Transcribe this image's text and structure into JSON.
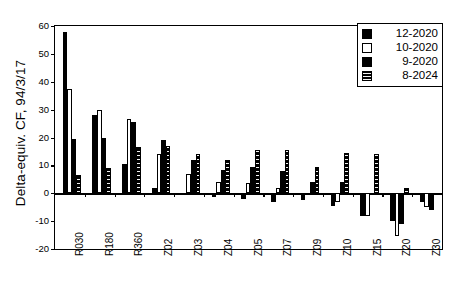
{
  "chart_data": {
    "type": "bar",
    "title": "",
    "subtitle": "",
    "xlabel": "",
    "ylabel": "Delta-equiv. CF, 94/3/17",
    "ylim": [
      -20,
      60
    ],
    "ytick_labels": [
      "60",
      "50",
      "40",
      "30",
      "20",
      "10",
      "0",
      "-10",
      "-20"
    ],
    "ytick_values": [
      60,
      50,
      40,
      30,
      20,
      10,
      0,
      -10,
      -20
    ],
    "grid": false,
    "legend_position": "top-right",
    "categories": [
      "R030",
      "R180",
      "R360",
      "Z02",
      "Z03",
      "Z04",
      "Z05",
      "Z07",
      "Z09",
      "Z10",
      "Z15",
      "Z20",
      "Z30"
    ],
    "series": [
      {
        "name": "12-2020",
        "style": "solid-black",
        "color": "#000000",
        "values": [
          58,
          28,
          10.5,
          2,
          -0.5,
          -1.5,
          -2,
          -3,
          -2.5,
          -4.5,
          -8,
          -10,
          -3
        ]
      },
      {
        "name": "10-2020",
        "style": "hollow-white",
        "color": "#ffffff",
        "values": [
          37.5,
          30,
          26.5,
          14,
          7,
          4,
          3.5,
          2,
          -0.5,
          -3,
          -8,
          -15.5,
          -5
        ]
      },
      {
        "name": "9-2020",
        "style": "solid-black",
        "color": "#000000",
        "values": [
          19.5,
          20,
          25.5,
          19,
          12,
          8.5,
          9.5,
          8,
          4,
          4,
          0,
          -11,
          -6
        ]
      },
      {
        "name": "8-2024",
        "style": "hatched-black",
        "color": "#000000",
        "values": [
          6.5,
          9,
          16.5,
          17,
          14,
          12,
          15.5,
          15.5,
          9.5,
          14.5,
          14,
          2,
          0
        ]
      }
    ]
  },
  "legend": {
    "entries": [
      {
        "label": "12-2020"
      },
      {
        "label": "10-2020"
      },
      {
        "label": "9-2020"
      },
      {
        "label": "8-2024"
      }
    ]
  }
}
